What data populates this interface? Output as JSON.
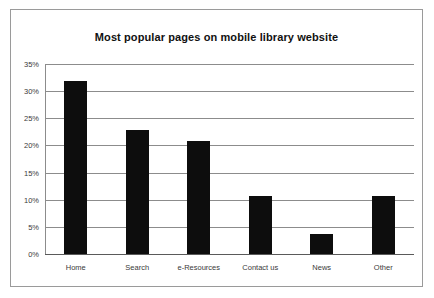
{
  "chart_data": {
    "type": "bar",
    "title": "Most popular pages on mobile library website",
    "xlabel": "",
    "ylabel": "",
    "categories": [
      "Home",
      "Search",
      "e-Resources",
      "Contact us",
      "News",
      "Other"
    ],
    "values": [
      31.9,
      22.8,
      20.8,
      10.7,
      3.7,
      10.7
    ],
    "ylim": [
      0,
      35
    ],
    "ytick_labels": [
      "0%",
      "5%",
      "10%",
      "15%",
      "20%",
      "25%",
      "30%",
      "35%"
    ],
    "ytick_values": [
      0,
      5,
      10,
      15,
      20,
      25,
      30,
      35
    ],
    "grid": true,
    "legend": "none",
    "bar_color": "#0d0d0d",
    "grid_color": "#8c8c8c",
    "border_color": "#9a9a9a",
    "background_color": "#ffffff"
  }
}
